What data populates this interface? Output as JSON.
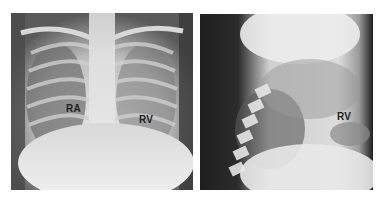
{
  "figure": {
    "panels": [
      {
        "id": "frontal",
        "description": "Frontal chest radiograph",
        "labels": [
          {
            "text": "RA",
            "x": 66,
            "y": 108
          },
          {
            "text": "RV",
            "x": 139,
            "y": 118
          }
        ]
      },
      {
        "id": "lateral",
        "description": "Lateral chest radiograph",
        "labels": [
          {
            "text": "RV",
            "x": 337,
            "y": 115
          }
        ]
      }
    ]
  }
}
